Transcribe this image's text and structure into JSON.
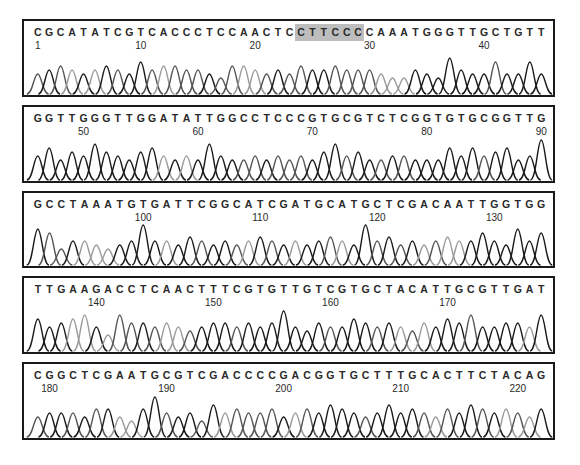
{
  "chart_data": {
    "type": "line",
    "xlabel": "Base position",
    "ylabel": "Fluorescence intensity",
    "highlight": {
      "start": 24,
      "end": 29,
      "color": "#bdbdbd"
    },
    "panels": [
      {
        "top": 19,
        "height": 78,
        "start": 1,
        "sequence": "CGCATATCGTCACCCTCCAACTCCTTCCCCAAATGGGTTGCTGTT",
        "ticks": [
          {
            "label": "1",
            "pos": 1
          },
          {
            "label": "10",
            "pos": 10
          },
          {
            "label": "20",
            "pos": 20
          },
          {
            "label": "30",
            "pos": 30
          },
          {
            "label": "40",
            "pos": 40
          }
        ],
        "peaks": [
          0.5,
          0.6,
          0.7,
          0.6,
          0.5,
          0.6,
          0.7,
          0.6,
          0.5,
          0.8,
          0.6,
          0.7,
          0.7,
          0.6,
          0.6,
          0.5,
          0.4,
          0.7,
          0.7,
          0.6,
          0.5,
          0.6,
          0.5,
          0.7,
          0.6,
          0.6,
          0.7,
          0.6,
          0.6,
          0.6,
          0.5,
          0.4,
          0.4,
          0.6,
          0.5,
          0.4,
          0.9,
          0.6,
          0.5,
          0.5,
          0.8,
          0.5,
          0.5,
          0.8,
          0.5,
          0.7
        ]
      },
      {
        "top": 105,
        "height": 78,
        "start": 46,
        "sequence": "GGTTGGGTTGGATATTGGCCTCCCGTGCGTCTCGGTGTGCGGTTG",
        "ticks": [
          {
            "label": "50",
            "pos": 50
          },
          {
            "label": "60",
            "pos": 60
          },
          {
            "label": "70",
            "pos": 70
          },
          {
            "label": "80",
            "pos": 80
          },
          {
            "label": "90",
            "pos": 90
          }
        ],
        "peaks": [
          0.6,
          0.8,
          0.5,
          0.7,
          0.6,
          0.9,
          0.7,
          0.6,
          0.5,
          0.7,
          0.8,
          0.6,
          0.5,
          0.6,
          0.5,
          0.9,
          0.6,
          0.5,
          0.5,
          0.6,
          0.5,
          0.6,
          0.5,
          0.6,
          0.5,
          0.7,
          0.9,
          0.6,
          0.7,
          0.5,
          0.5,
          0.6,
          0.6,
          0.5,
          0.5,
          0.5,
          0.8,
          0.6,
          0.8,
          0.6,
          0.7,
          0.8,
          0.5,
          0.6,
          1.0
        ]
      },
      {
        "top": 191,
        "height": 77,
        "start": 91,
        "sequence": "GCCTAAATGTGATTCGGCATCGATGCATGCTCGACAATTGGTGG",
        "ticks": [
          {
            "label": "100",
            "pos": 100
          },
          {
            "label": "110",
            "pos": 110
          },
          {
            "label": "120",
            "pos": 120
          },
          {
            "label": "130",
            "pos": 130
          }
        ],
        "peaks": [
          0.9,
          0.8,
          0.4,
          0.6,
          0.6,
          0.5,
          0.4,
          0.5,
          0.6,
          1.0,
          0.6,
          0.6,
          0.5,
          0.7,
          0.6,
          0.5,
          0.6,
          0.5,
          0.6,
          0.7,
          0.6,
          0.5,
          0.6,
          0.5,
          0.6,
          0.7,
          0.6,
          0.5,
          1.0,
          0.6,
          0.7,
          0.5,
          0.6,
          0.5,
          0.6,
          0.7,
          0.6,
          0.6,
          0.8,
          0.6,
          0.5,
          0.9,
          0.6,
          0.8
        ]
      },
      {
        "top": 276,
        "height": 78,
        "start": 135,
        "sequence": "TTGAAGACCTCAACTTTCGTGTTGTCGTGCTACATTGCGTTGAT",
        "ticks": [
          {
            "label": "140",
            "pos": 140
          },
          {
            "label": "150",
            "pos": 150
          },
          {
            "label": "160",
            "pos": 160
          },
          {
            "label": "170",
            "pos": 170
          }
        ],
        "peaks": [
          0.8,
          0.6,
          0.7,
          0.8,
          0.9,
          0.6,
          0.4,
          0.9,
          0.7,
          0.7,
          0.6,
          0.7,
          0.6,
          0.5,
          0.6,
          0.7,
          0.7,
          0.6,
          0.7,
          0.6,
          0.7,
          1.0,
          0.6,
          0.5,
          0.7,
          0.6,
          0.6,
          0.8,
          0.7,
          0.6,
          0.7,
          0.6,
          0.5,
          0.7,
          0.6,
          0.8,
          0.7,
          0.9,
          0.6,
          0.6,
          0.7,
          0.7,
          0.6,
          0.9,
          0.5
        ]
      },
      {
        "top": 362,
        "height": 78,
        "start": 179,
        "sequence": "CGGCTCGAATGCGTCGACCCCGACGGTGCTTTGCACTTCTACAG",
        "ticks": [
          {
            "label": "180",
            "pos": 180
          },
          {
            "label": "190",
            "pos": 190
          },
          {
            "label": "200",
            "pos": 200
          },
          {
            "label": "210",
            "pos": 210
          },
          {
            "label": "220",
            "pos": 220
          }
        ],
        "peaks": [
          0.5,
          0.6,
          0.6,
          0.6,
          0.5,
          0.7,
          0.7,
          0.5,
          0.4,
          0.7,
          1.0,
          0.6,
          0.5,
          0.6,
          0.4,
          0.8,
          0.6,
          0.7,
          0.6,
          0.6,
          0.7,
          0.5,
          0.6,
          0.7,
          0.6,
          0.8,
          0.7,
          0.6,
          0.5,
          0.6,
          0.8,
          0.6,
          0.7,
          0.6,
          0.5,
          0.7,
          0.6,
          0.8,
          0.7,
          0.6,
          0.7,
          0.6,
          0.5,
          0.7
        ]
      }
    ]
  },
  "colors": {
    "dark": "#1a1a1a",
    "mid": "#555555",
    "light": "#9a9a9a"
  }
}
